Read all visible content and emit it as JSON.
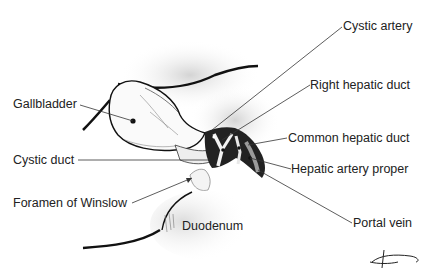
{
  "diagram": {
    "type": "anatomical-illustration",
    "labels": {
      "gallbladder": "Gallbladder",
      "cystic_duct": "Cystic duct",
      "foramen_of_winslow": "Foramen of Winslow",
      "duodenum": "Duodenum",
      "cystic_artery": "Cystic artery",
      "right_hepatic_duct": "Right hepatic duct",
      "common_hepatic_duct": "Common hepatic duct",
      "hepatic_artery_proper": "Hepatic artery proper",
      "portal_vein": "Portal vein"
    },
    "colors": {
      "ink": "#1a1a1a",
      "shade": "#c8c8c8",
      "background": "#ffffff"
    }
  }
}
